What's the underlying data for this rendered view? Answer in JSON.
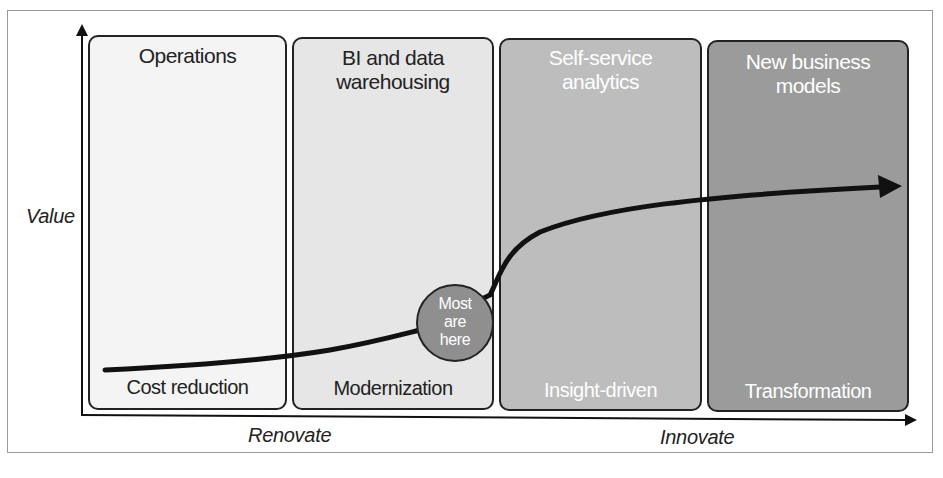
{
  "diagram": {
    "y_axis_label": "Value",
    "x_axis_labels": {
      "left": "Renovate",
      "right": "Innovate"
    },
    "panels": [
      {
        "title": "Operations",
        "footer": "Cost reduction",
        "fill": "#f4f4f4",
        "text_color": "#222222"
      },
      {
        "title": "BI and data warehousing",
        "title_lines": [
          "BI and data",
          "warehousing"
        ],
        "footer": "Modernization",
        "fill": "#e6e6e6",
        "text_color": "#222222"
      },
      {
        "title": "Self-service analytics",
        "title_lines": [
          "Self-service",
          "analytics"
        ],
        "footer": "Insight-driven",
        "fill": "#bdbdbd",
        "text_color": "#ffffff"
      },
      {
        "title": "New business models",
        "title_lines": [
          "New business",
          "models"
        ],
        "footer": "Transformation",
        "fill": "#9b9b9b",
        "text_color": "#ffffff"
      }
    ],
    "marker": {
      "lines": [
        "Most",
        "are",
        "here"
      ],
      "text": "Most are here",
      "fill": "#8f8f8f"
    },
    "curve": {
      "description": "S-shaped value curve rising from Operations to New business models, ending in arrow",
      "color": "#111111"
    }
  }
}
